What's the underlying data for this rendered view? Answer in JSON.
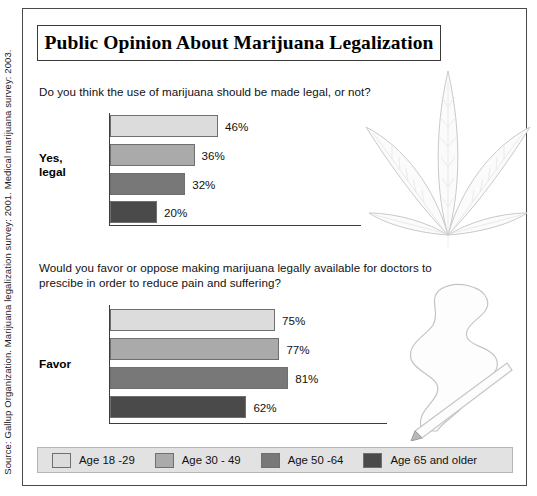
{
  "title": "Public Opinion About Marijuana Legalization",
  "source_note": "Source: Gallup Organization. Marijuana legalization survey: 2001. Medical marijuana survey: 2003.",
  "legend": {
    "items": [
      {
        "label": "Age 18 -29",
        "color": "#dcdcdc"
      },
      {
        "label": "Age 30 - 49",
        "color": "#aaaaaa"
      },
      {
        "label": "Age 50 -64",
        "color": "#787878"
      },
      {
        "label": "Age 65 and older",
        "color": "#4a4a4a"
      }
    ]
  },
  "charts": [
    {
      "question": "Do you think the use of marijuana should be made legal, or not?",
      "category_label_line1": "Yes,",
      "category_label_line2": "legal",
      "values": [
        {
          "label": "46%",
          "value": 46,
          "color": "#dcdcdc"
        },
        {
          "label": "36%",
          "value": 36,
          "color": "#aaaaaa"
        },
        {
          "label": "32%",
          "value": 32,
          "color": "#787878"
        },
        {
          "label": "20%",
          "value": 20,
          "color": "#4a4a4a"
        }
      ]
    },
    {
      "question": "Would you favor or oppose making marijuana legally available for doctors to prescibe in order to reduce pain and suffering?",
      "category_label_line1": "Favor",
      "category_label_line2": "",
      "values": [
        {
          "label": "75%",
          "value": 75,
          "color": "#dcdcdc"
        },
        {
          "label": "77%",
          "value": 77,
          "color": "#aaaaaa"
        },
        {
          "label": "81%",
          "value": 81,
          "color": "#787878"
        },
        {
          "label": "62%",
          "value": 62,
          "color": "#4a4a4a"
        }
      ]
    }
  ],
  "artwork": [
    {
      "name": "marijuana-leaf-illustration"
    },
    {
      "name": "lit-joint-with-smoke-illustration"
    }
  ],
  "chart_data": [
    {
      "type": "bar",
      "title": "Do you think the use of marijuana should be made legal, or not?",
      "orientation": "horizontal",
      "categories": [
        "Age 18 -29",
        "Age 30 - 49",
        "Age 50 -64",
        "Age 65 and older"
      ],
      "values": [
        46,
        36,
        32,
        20
      ],
      "xlabel": "",
      "ylabel": "Yes, legal",
      "xlim": [
        0,
        100
      ],
      "unit": "percent",
      "grid": false,
      "legend_position": "bottom"
    },
    {
      "type": "bar",
      "title": "Would you favor or oppose making marijuana legally available for doctors to prescibe in order to reduce pain and suffering?",
      "orientation": "horizontal",
      "categories": [
        "Age 18 -29",
        "Age 30 - 49",
        "Age 50 -64",
        "Age 65 and older"
      ],
      "values": [
        75,
        77,
        81,
        62
      ],
      "xlabel": "",
      "ylabel": "Favor",
      "xlim": [
        0,
        100
      ],
      "unit": "percent",
      "grid": false,
      "legend_position": "bottom"
    }
  ]
}
